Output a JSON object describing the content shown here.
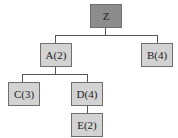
{
  "diagram": {
    "type": "tree",
    "nodes": [
      {
        "id": "Z",
        "label": "Z"
      },
      {
        "id": "A",
        "label": "A(2)"
      },
      {
        "id": "B",
        "label": "B(4)"
      },
      {
        "id": "C",
        "label": "C(3)"
      },
      {
        "id": "D",
        "label": "D(4)"
      },
      {
        "id": "E",
        "label": "E(2)"
      }
    ],
    "edges": [
      [
        "Z",
        "A"
      ],
      [
        "Z",
        "B"
      ],
      [
        "A",
        "C"
      ],
      [
        "A",
        "D"
      ],
      [
        "D",
        "E"
      ]
    ],
    "colors": {
      "root_fill": "#8c8c8c",
      "node_fill": "#d3d3d3",
      "border": "#6e6e6e",
      "edge": "#555555"
    }
  }
}
